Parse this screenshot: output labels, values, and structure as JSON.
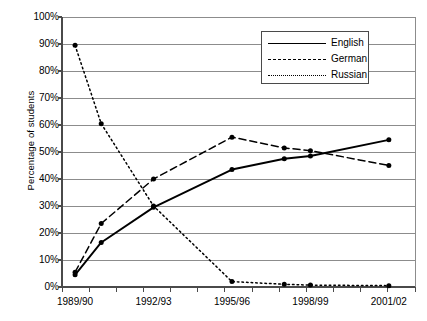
{
  "chart_data": {
    "type": "line",
    "title": "",
    "xlabel": "",
    "ylabel": "Percentage of students",
    "ylim": [
      0,
      100
    ],
    "ytick_labels": [
      "100%",
      "90%",
      "80%",
      "70%",
      "60%",
      "50%",
      "40%",
      "30%",
      "20%",
      "10%",
      "0%"
    ],
    "ytick_values": [
      100,
      90,
      80,
      70,
      60,
      50,
      40,
      30,
      20,
      10,
      0
    ],
    "grid": true,
    "legend_position": "top-right",
    "xtick_labels": [
      "1989/90",
      "1992/93",
      "1995/96",
      "1998/99",
      "2001/02"
    ],
    "xtick_values": [
      1989,
      1992,
      1995,
      1998,
      2001
    ],
    "x_axis_minor_ticks": 13,
    "x": [
      1989,
      1990,
      1992,
      1995,
      1997,
      1998,
      2001
    ],
    "x_labels": [
      "1989/90",
      "1990/91",
      "1992/93",
      "1995/96",
      "1997/98",
      "1998/99",
      "2001/02"
    ],
    "series": [
      {
        "name": "English",
        "style": "solid",
        "marker": "circle",
        "color": "#000000",
        "values": [
          4.5,
          16.5,
          29.5,
          43.5,
          47.5,
          48.5,
          54.5
        ]
      },
      {
        "name": "German",
        "style": "dashed",
        "marker": "circle",
        "color": "#000000",
        "values": [
          5.5,
          23.5,
          40.0,
          55.5,
          51.5,
          50.5,
          45.0
        ]
      },
      {
        "name": "Russian",
        "style": "dotted",
        "marker": "circle",
        "color": "#000000",
        "values": [
          89.5,
          60.5,
          30.0,
          2.0,
          1.0,
          0.7,
          0.5
        ]
      }
    ]
  },
  "legend": {
    "entries": [
      {
        "label": "English",
        "style": "solid"
      },
      {
        "label": "German",
        "style": "dashed"
      },
      {
        "label": "Russian",
        "style": "dotted"
      }
    ]
  }
}
